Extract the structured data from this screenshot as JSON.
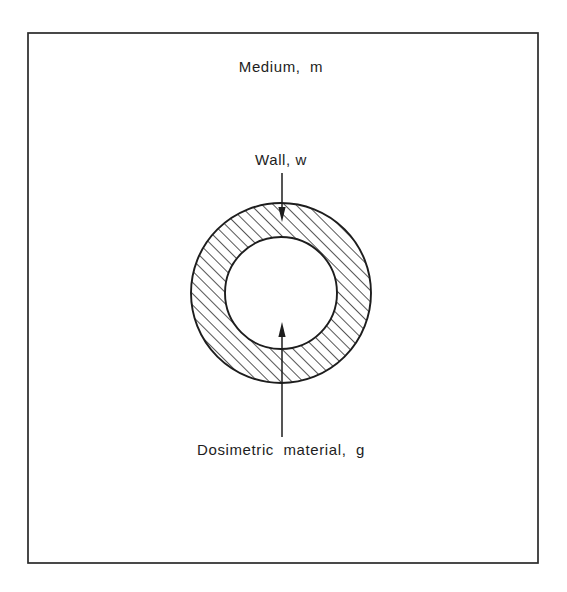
{
  "figure": {
    "background_color": "#ffffff",
    "line_color": "#1d1d1d",
    "frame": {
      "name": "outer-border",
      "x": 28,
      "y": 33,
      "width": 510,
      "height": 530,
      "stroke_color": "#2a2a2a"
    },
    "labels": {
      "medium": "Medium,  m",
      "wall": "Wall, w",
      "dosimetric_material": "Dosimetric  material,  g"
    },
    "geometry": {
      "center_x": 281,
      "center_y": 293,
      "outer_radius": 90,
      "inner_radius": 56,
      "hatch_angle_deg": 45,
      "hatch_spacing_px": 8,
      "hatch_region": "annulus between inner and outer circle",
      "cavity_fill": "#ffffff"
    },
    "annotations": [
      {
        "id": "medium-label",
        "text": "Medium,  m",
        "text_x": 281,
        "text_y": 72,
        "has_leader": false
      },
      {
        "id": "wall-label",
        "text": "Wall, w",
        "text_x": 281,
        "text_y": 165,
        "has_leader": true,
        "leader_from_y": 173,
        "leader_to_y": 222,
        "arrow_direction": "down",
        "points_to": "wall annulus"
      },
      {
        "id": "dosimetric-label",
        "text": "Dosimetric  material,  g",
        "text_x": 281,
        "text_y": 455,
        "has_leader": true,
        "leader_from_y": 437,
        "leader_to_y": 322,
        "arrow_direction": "up",
        "points_to": "inner cavity"
      }
    ]
  }
}
